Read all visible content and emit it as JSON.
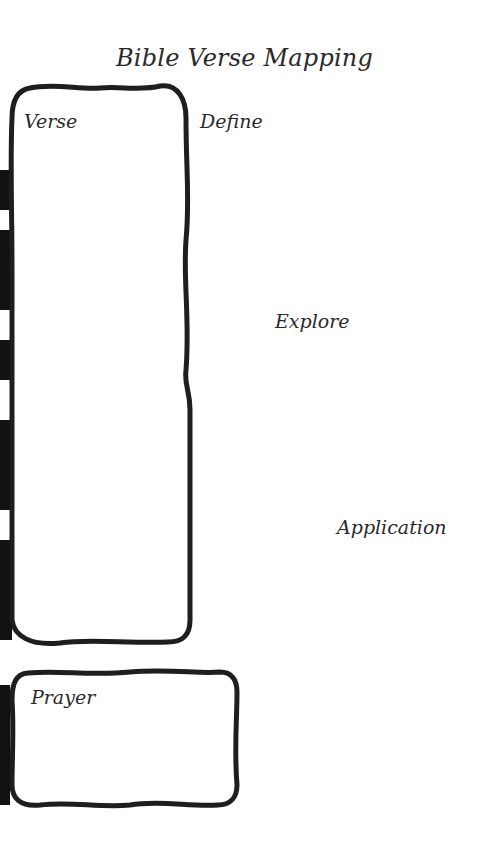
{
  "page": {
    "title": "Bible Verse Mapping",
    "sections": {
      "verse": {
        "label": "Verse"
      },
      "define": {
        "label": "Define"
      },
      "explore": {
        "label": "Explore"
      },
      "application": {
        "label": "Application"
      },
      "prayer": {
        "label": "Prayer"
      }
    }
  },
  "colors": {
    "ink": "#1e1e1e",
    "paper": "#ffffff",
    "text": "#2a2a2a"
  }
}
